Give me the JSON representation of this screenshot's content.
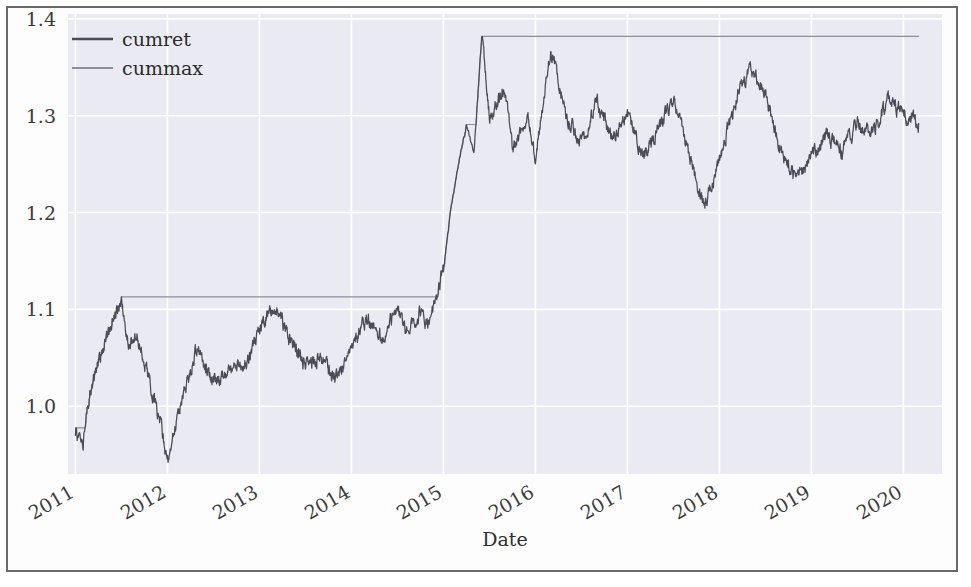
{
  "chart_data": {
    "type": "line",
    "title": "",
    "xlabel": "Date",
    "ylabel": "",
    "xlim": [
      "2010-12-01",
      "2020-06-01"
    ],
    "ylim": [
      0.93,
      1.405
    ],
    "grid": true,
    "style": "seaborn-darkgrid",
    "legend_position": "upper left",
    "xtick_labels": [
      "2011",
      "2012",
      "2013",
      "2014",
      "2015",
      "2016",
      "2017",
      "2018",
      "2019",
      "2020"
    ],
    "xtick_rotation": -30,
    "ytick_labels": [
      "1.0",
      "1.1",
      "1.2",
      "1.3",
      "1.4"
    ],
    "ytick_values": [
      1.0,
      1.1,
      1.2,
      1.3,
      1.4
    ],
    "colors": {
      "plot_background": "#eaeaf2",
      "grid": "#ffffff",
      "cumret": "#4c4c58",
      "cummax": "#8f8f9c",
      "figure_background": "#fdfdfd",
      "frame_border": "#6a6a6a",
      "text": "#3b3b3b"
    },
    "series": [
      {
        "name": "cumret",
        "color": "#4c4c58",
        "linewidth": 1.3,
        "description": "Cumulative return of strategy, daily, 2011-01 through 2020-03",
        "start_value": 0.97,
        "end_value": 1.292,
        "min_value": 0.944,
        "max_value": 1.383,
        "waypoints": [
          {
            "date": "2011-01",
            "value": 0.972
          },
          {
            "date": "2011-02",
            "value": 0.962
          },
          {
            "date": "2011-03",
            "value": 1.018
          },
          {
            "date": "2011-05",
            "value": 1.071
          },
          {
            "date": "2011-07",
            "value": 1.108
          },
          {
            "date": "2011-08",
            "value": 1.062
          },
          {
            "date": "2011-09",
            "value": 1.073
          },
          {
            "date": "2011-10",
            "value": 1.046
          },
          {
            "date": "2011-12",
            "value": 0.985
          },
          {
            "date": "2012-01",
            "value": 0.944
          },
          {
            "date": "2012-03",
            "value": 1.012
          },
          {
            "date": "2012-05",
            "value": 1.062
          },
          {
            "date": "2012-07",
            "value": 1.022
          },
          {
            "date": "2012-09",
            "value": 1.036
          },
          {
            "date": "2012-11",
            "value": 1.042
          },
          {
            "date": "2013-01",
            "value": 1.078
          },
          {
            "date": "2013-03",
            "value": 1.105
          },
          {
            "date": "2013-05",
            "value": 1.068
          },
          {
            "date": "2013-07",
            "value": 1.042
          },
          {
            "date": "2013-09",
            "value": 1.05
          },
          {
            "date": "2013-11",
            "value": 1.028
          },
          {
            "date": "2014-01",
            "value": 1.062
          },
          {
            "date": "2014-03",
            "value": 1.09
          },
          {
            "date": "2014-05",
            "value": 1.07
          },
          {
            "date": "2014-07",
            "value": 1.105
          },
          {
            "date": "2014-08",
            "value": 1.078
          },
          {
            "date": "2014-10",
            "value": 1.097
          },
          {
            "date": "2014-11",
            "value": 1.082
          },
          {
            "date": "2015-01",
            "value": 1.14
          },
          {
            "date": "2015-02",
            "value": 1.205
          },
          {
            "date": "2015-03",
            "value": 1.252
          },
          {
            "date": "2015-04",
            "value": 1.29
          },
          {
            "date": "2015-05",
            "value": 1.262
          },
          {
            "date": "2015-06",
            "value": 1.383
          },
          {
            "date": "2015-07",
            "value": 1.3
          },
          {
            "date": "2015-09",
            "value": 1.33
          },
          {
            "date": "2015-10",
            "value": 1.262
          },
          {
            "date": "2015-12",
            "value": 1.305
          },
          {
            "date": "2016-01",
            "value": 1.255
          },
          {
            "date": "2016-03",
            "value": 1.37
          },
          {
            "date": "2016-05",
            "value": 1.3
          },
          {
            "date": "2016-07",
            "value": 1.27
          },
          {
            "date": "2016-09",
            "value": 1.315
          },
          {
            "date": "2016-11",
            "value": 1.275
          },
          {
            "date": "2017-01",
            "value": 1.302
          },
          {
            "date": "2017-03",
            "value": 1.258
          },
          {
            "date": "2017-05",
            "value": 1.286
          },
          {
            "date": "2017-07",
            "value": 1.318
          },
          {
            "date": "2017-09",
            "value": 1.262
          },
          {
            "date": "2017-11",
            "value": 1.205
          },
          {
            "date": "2018-01",
            "value": 1.255
          },
          {
            "date": "2018-03",
            "value": 1.312
          },
          {
            "date": "2018-05",
            "value": 1.35
          },
          {
            "date": "2018-07",
            "value": 1.322
          },
          {
            "date": "2018-09",
            "value": 1.262
          },
          {
            "date": "2018-11",
            "value": 1.232
          },
          {
            "date": "2019-01",
            "value": 1.258
          },
          {
            "date": "2019-03",
            "value": 1.28
          },
          {
            "date": "2019-05",
            "value": 1.262
          },
          {
            "date": "2019-07",
            "value": 1.292
          },
          {
            "date": "2019-09",
            "value": 1.282
          },
          {
            "date": "2019-11",
            "value": 1.318
          },
          {
            "date": "2020-01",
            "value": 1.302
          },
          {
            "date": "2020-03",
            "value": 1.292
          }
        ]
      },
      {
        "name": "cummax",
        "color": "#8f8f9c",
        "linewidth": 1.1,
        "description": "Running maximum of cumret (step function)",
        "plateaus": [
          {
            "from": "2011-07",
            "to": "2014-07",
            "value": 1.108
          },
          {
            "from": "2015-06",
            "to": "2020-03",
            "value": 1.383
          }
        ]
      }
    ]
  },
  "legend": {
    "entries": [
      {
        "label": "cumret",
        "color": "#4c4c58"
      },
      {
        "label": "cummax",
        "color": "#8f8f9c"
      }
    ]
  },
  "axes": {
    "x_title": "Date",
    "y_title": ""
  }
}
